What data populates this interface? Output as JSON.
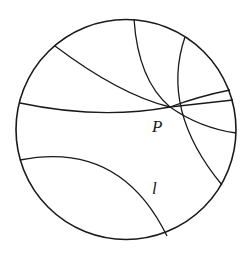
{
  "diagram": {
    "stroke_color": "#1a1a1a",
    "background": "#ffffff",
    "disk": {
      "cx": 126,
      "cy": 129.5,
      "r": 110
    },
    "point_P": {
      "x": 170,
      "y": 107
    },
    "labels": {
      "P": "P",
      "l": "l"
    },
    "curves": [
      {
        "name": "geodesic-top-left",
        "d": "M 55 46 Q 120 95 170 107"
      },
      {
        "name": "geodesic-top",
        "d": "M 134 19 Q 138 80 170 107"
      },
      {
        "name": "geodesic-top-right-to-bottom-right",
        "d": "M 185 37 Q 160 110 222 185"
      },
      {
        "name": "geodesic-left-horizontal",
        "d": "M 20 103 Q 100 120 170 107"
      },
      {
        "name": "geodesic-P-right-upper",
        "d": "M 170 107 Q 200 96 230 90"
      },
      {
        "name": "geodesic-P-right-middle",
        "d": "M 170 107 Q 205 103 233 100"
      },
      {
        "name": "geodesic-P-right-lower",
        "d": "M 170 107 Q 200 128 236 133"
      },
      {
        "name": "line-l",
        "d": "M 20 160 Q 120 140 167 236"
      }
    ]
  }
}
